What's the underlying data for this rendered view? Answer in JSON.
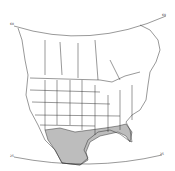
{
  "map": {
    "title": "",
    "region": "North America (USA, southern Canada, northern Mexico)",
    "projection_labels": {
      "top_left": "60",
      "top_right": "60",
      "bottom_left": "25",
      "bottom_right": "25"
    },
    "shaded_region": "Southern US Gulf coast, Texas, Florida and northern Mexico (hatched)",
    "colors": {
      "stroke": "#333333",
      "background": "#ffffff",
      "hatch": "#222222"
    }
  }
}
